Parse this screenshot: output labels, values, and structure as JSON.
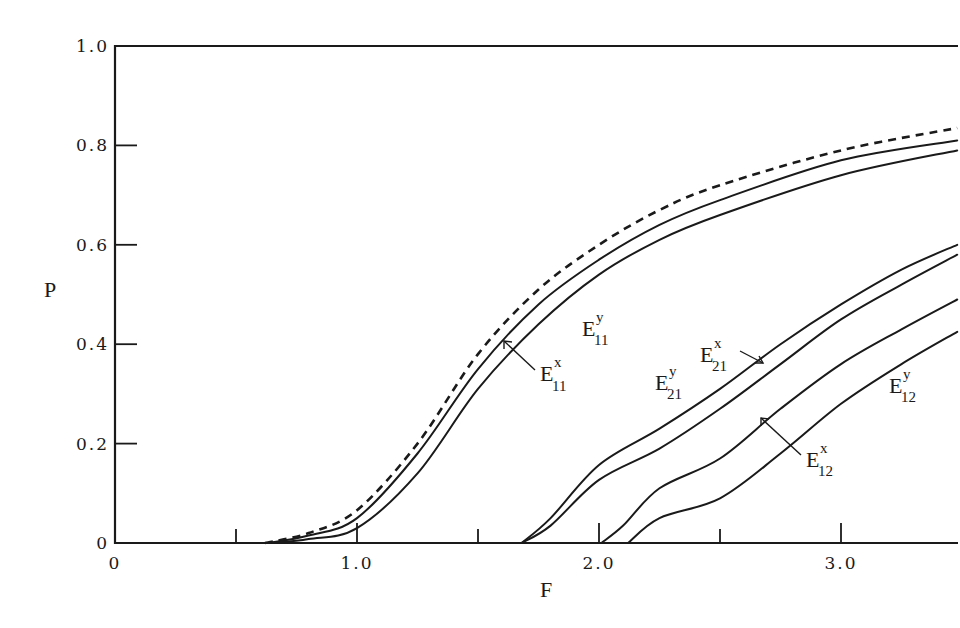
{
  "chart_data": {
    "type": "line",
    "title": "",
    "xlabel": "F",
    "ylabel": "P",
    "xlim": [
      0,
      3.5
    ],
    "ylim": [
      0,
      1.0
    ],
    "grid": false,
    "legend": "inline labels with arrows",
    "x_ticks": [
      {
        "value": 0,
        "label": "0"
      },
      {
        "value": 0.5,
        "label": ""
      },
      {
        "value": 1.0,
        "label": "1.0"
      },
      {
        "value": 1.5,
        "label": ""
      },
      {
        "value": 2.0,
        "label": "2.0"
      },
      {
        "value": 2.5,
        "label": ""
      },
      {
        "value": 3.0,
        "label": "3.0"
      }
    ],
    "y_ticks": [
      {
        "value": 0,
        "label": "0"
      },
      {
        "value": 0.2,
        "label": "0.2"
      },
      {
        "value": 0.4,
        "label": "0.4"
      },
      {
        "value": 0.6,
        "label": "0.6"
      },
      {
        "value": 0.8,
        "label": "0.8"
      },
      {
        "value": 1.0,
        "label": "1.0"
      }
    ],
    "series": [
      {
        "name": "dashed (unlabeled)",
        "style": "dashed",
        "x": [
          0.62,
          0.8,
          1.0,
          1.25,
          1.5,
          1.75,
          2.0,
          2.25,
          2.5,
          3.0,
          3.48
        ],
        "y": [
          0.0,
          0.02,
          0.066,
          0.2,
          0.38,
          0.51,
          0.6,
          0.67,
          0.72,
          0.79,
          0.835
        ]
      },
      {
        "name": "E11^x",
        "label": "E",
        "sup": "x",
        "sub": "11",
        "style": "solid",
        "x": [
          0.63,
          0.8,
          1.0,
          1.25,
          1.5,
          1.75,
          2.0,
          2.25,
          2.5,
          3.0,
          3.48
        ],
        "y": [
          0.0,
          0.015,
          0.05,
          0.18,
          0.35,
          0.48,
          0.57,
          0.64,
          0.69,
          0.77,
          0.81
        ]
      },
      {
        "name": "E11^y",
        "label": "E",
        "sup": "y",
        "sub": "11",
        "style": "solid",
        "x": [
          0.65,
          0.8,
          1.0,
          1.25,
          1.5,
          1.75,
          2.0,
          2.25,
          2.5,
          3.0,
          3.48
        ],
        "y": [
          0.0,
          0.008,
          0.03,
          0.14,
          0.31,
          0.44,
          0.54,
          0.61,
          0.66,
          0.74,
          0.79
        ]
      },
      {
        "name": "E21^y",
        "label": "E",
        "sup": "y",
        "sub": "21",
        "style": "solid",
        "x": [
          1.68,
          1.8,
          2.0,
          2.25,
          2.5,
          2.75,
          3.0,
          3.25,
          3.48
        ],
        "y": [
          0.0,
          0.05,
          0.157,
          0.23,
          0.31,
          0.4,
          0.48,
          0.55,
          0.6
        ]
      },
      {
        "name": "E21^x",
        "label": "E",
        "sup": "x",
        "sub": "21",
        "style": "solid",
        "x": [
          1.68,
          1.8,
          2.0,
          2.25,
          2.5,
          2.75,
          3.0,
          3.25,
          3.48
        ],
        "y": [
          0.0,
          0.035,
          0.127,
          0.19,
          0.27,
          0.36,
          0.45,
          0.52,
          0.58
        ]
      },
      {
        "name": "E12^x",
        "label": "E",
        "sup": "x",
        "sub": "12",
        "style": "solid",
        "x": [
          2.01,
          2.1,
          2.25,
          2.5,
          2.75,
          3.0,
          3.25,
          3.48
        ],
        "y": [
          0.0,
          0.035,
          0.11,
          0.17,
          0.27,
          0.36,
          0.43,
          0.49
        ]
      },
      {
        "name": "E12^y",
        "label": "E",
        "sup": "y",
        "sub": "12",
        "style": "solid",
        "x": [
          2.12,
          2.25,
          2.5,
          2.75,
          3.0,
          3.25,
          3.48
        ],
        "y": [
          0.0,
          0.05,
          0.09,
          0.18,
          0.28,
          0.36,
          0.425
        ]
      }
    ]
  },
  "labels": {
    "x_axis_title": "F",
    "y_axis_title": "P",
    "curve_E11x": {
      "main": "E",
      "sup": "x",
      "sub": "11"
    },
    "curve_E11y": {
      "main": "E",
      "sup": "y",
      "sub": "11"
    },
    "curve_E21x": {
      "main": "E",
      "sup": "x",
      "sub": "21"
    },
    "curve_E21y": {
      "main": "E",
      "sup": "y",
      "sub": "21"
    },
    "curve_E12x": {
      "main": "E",
      "sup": "x",
      "sub": "12"
    },
    "curve_E12y": {
      "main": "E",
      "sup": "y",
      "sub": "12"
    }
  },
  "layout": {
    "origin_px": [
      115,
      543
    ],
    "x_unit_px": 242,
    "y_unit_px": 497,
    "right_edge_px": 958,
    "top_edge_px": 46,
    "line_color": "#1a1a1a",
    "background": "#ffffff"
  }
}
